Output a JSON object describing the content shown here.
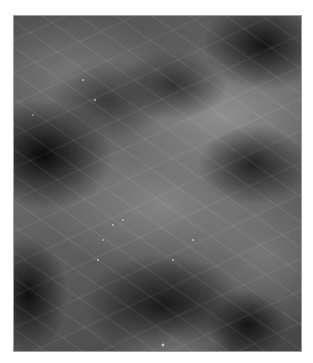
{
  "image": {
    "description": "Grayscale fluorescence micrograph showing filamentous cellular structures with dark nuclear regions",
    "colors": {
      "background": "#ffffff",
      "dark_region": "#1e1e1e",
      "bright_region": "#b4b4b4"
    }
  }
}
